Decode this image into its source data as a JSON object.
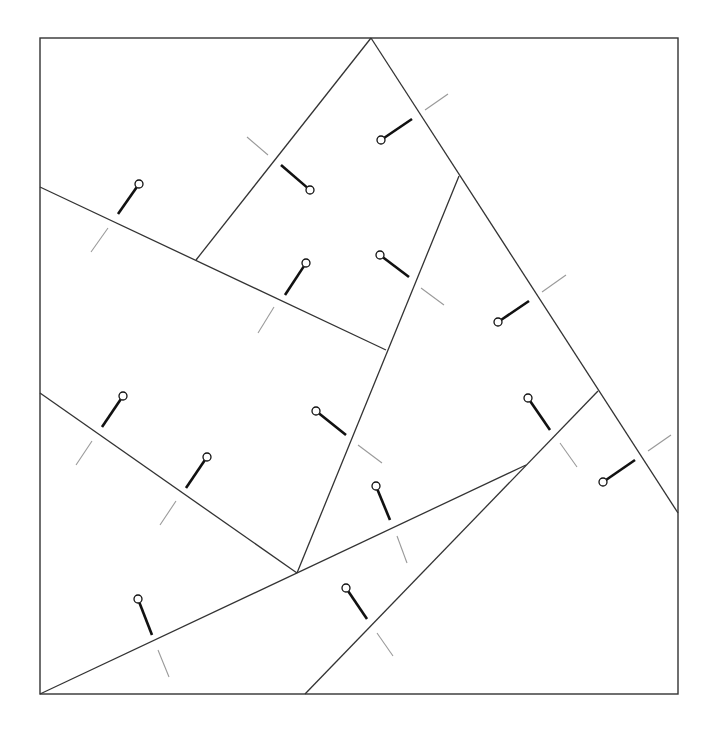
{
  "diagram": {
    "colors": {
      "background": "#ffffff",
      "line": "#333333",
      "pin": "#111111",
      "tick": "#9a9a9a"
    },
    "frame": {
      "x": 40,
      "y": 38,
      "width": 638,
      "height": 656
    },
    "edges": [
      {
        "id": "e1",
        "x1": 371,
        "y1": 38,
        "x2": 196,
        "y2": 260
      },
      {
        "id": "e2",
        "x1": 371,
        "y1": 38,
        "x2": 678,
        "y2": 513
      },
      {
        "id": "e3",
        "x1": 40,
        "y1": 187,
        "x2": 386,
        "y2": 350
      },
      {
        "id": "e4",
        "x1": 459,
        "y1": 176,
        "x2": 297,
        "y2": 573
      },
      {
        "id": "e5",
        "x1": 40,
        "y1": 393,
        "x2": 297,
        "y2": 573
      },
      {
        "id": "e6",
        "x1": 40,
        "y1": 694,
        "x2": 526,
        "y2": 465
      },
      {
        "id": "e7",
        "x1": 305,
        "y1": 694,
        "x2": 598,
        "y2": 391
      }
    ],
    "pins": [
      {
        "head": [
          139,
          184
        ],
        "tip": [
          118,
          214
        ],
        "tick": [
          [
            108,
            228
          ],
          [
            91,
            252
          ]
        ]
      },
      {
        "head": [
          310,
          190
        ],
        "tip": [
          281,
          165
        ],
        "tick": [
          [
            268,
            155
          ],
          [
            247,
            137
          ]
        ]
      },
      {
        "head": [
          381,
          140
        ],
        "tip": [
          412,
          119
        ],
        "tick": [
          [
            425,
            110
          ],
          [
            448,
            94
          ]
        ]
      },
      {
        "head": [
          306,
          263
        ],
        "tip": [
          285,
          295
        ],
        "tick": [
          [
            274,
            307
          ],
          [
            258,
            333
          ]
        ]
      },
      {
        "head": [
          380,
          255
        ],
        "tip": [
          409,
          277
        ],
        "tick": [
          [
            421,
            288
          ],
          [
            444,
            305
          ]
        ]
      },
      {
        "head": [
          498,
          322
        ],
        "tip": [
          529,
          301
        ],
        "tick": [
          [
            542,
            292
          ],
          [
            566,
            275
          ]
        ]
      },
      {
        "head": [
          123,
          396
        ],
        "tip": [
          102,
          427
        ],
        "tick": [
          [
            92,
            441
          ],
          [
            76,
            465
          ]
        ]
      },
      {
        "head": [
          207,
          457
        ],
        "tip": [
          186,
          488
        ],
        "tick": [
          [
            176,
            501
          ],
          [
            160,
            525
          ]
        ]
      },
      {
        "head": [
          316,
          411
        ],
        "tip": [
          346,
          435
        ],
        "tick": [
          [
            358,
            445
          ],
          [
            382,
            463
          ]
        ]
      },
      {
        "head": [
          376,
          486
        ],
        "tip": [
          390,
          520
        ],
        "tick": [
          [
            397,
            536
          ],
          [
            407,
            563
          ]
        ]
      },
      {
        "head": [
          528,
          398
        ],
        "tip": [
          550,
          430
        ],
        "tick": [
          [
            560,
            443
          ],
          [
            577,
            467
          ]
        ]
      },
      {
        "head": [
          603,
          482
        ],
        "tip": [
          635,
          460
        ],
        "tick": [
          [
            648,
            451
          ],
          [
            671,
            435
          ]
        ]
      },
      {
        "head": [
          138,
          599
        ],
        "tip": [
          152,
          635
        ],
        "tick": [
          [
            158,
            650
          ],
          [
            169,
            677
          ]
        ]
      },
      {
        "head": [
          346,
          588
        ],
        "tip": [
          367,
          619
        ],
        "tick": [
          [
            377,
            633
          ],
          [
            393,
            656
          ]
        ]
      }
    ],
    "pin_head_radius": 4
  }
}
